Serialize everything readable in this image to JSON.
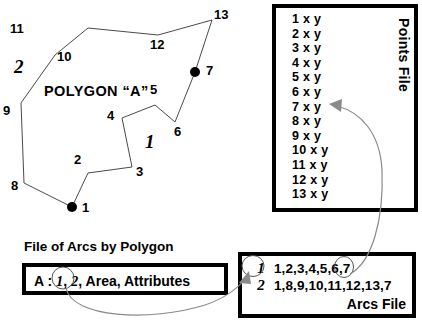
{
  "diagram": {
    "polygon": {
      "title": "POLYGON “A”",
      "arc_labels": [
        {
          "id": "arc-label-2",
          "text": "2",
          "x": 14,
          "y": 57
        },
        {
          "id": "arc-label-1",
          "text": "1",
          "x": 145,
          "y": 132
        }
      ],
      "vertex_labels": [
        {
          "id": "vertex-1",
          "text": "1",
          "x": 82,
          "y": 201
        },
        {
          "id": "vertex-2",
          "text": "2",
          "x": 74,
          "y": 153
        },
        {
          "id": "vertex-3",
          "text": "3",
          "x": 136,
          "y": 165
        },
        {
          "id": "vertex-4",
          "text": "4",
          "x": 107,
          "y": 109
        },
        {
          "id": "vertex-5",
          "text": "5",
          "x": 150,
          "y": 83
        },
        {
          "id": "vertex-6",
          "text": "6",
          "x": 174,
          "y": 125
        },
        {
          "id": "vertex-7",
          "text": "7",
          "x": 206,
          "y": 64
        },
        {
          "id": "vertex-8",
          "text": "8",
          "x": 11,
          "y": 179
        },
        {
          "id": "vertex-9",
          "text": "9",
          "x": 3,
          "y": 104
        },
        {
          "id": "vertex-10",
          "text": "10",
          "x": 57,
          "y": 50
        },
        {
          "id": "vertex-11",
          "text": "11",
          "x": 10,
          "y": 22
        },
        {
          "id": "vertex-12",
          "text": "12",
          "x": 150,
          "y": 38
        },
        {
          "id": "vertex-13",
          "text": "13",
          "x": 214,
          "y": 8
        }
      ],
      "nodes": [
        {
          "id": "node-1",
          "x": 72,
          "y": 207
        },
        {
          "id": "node-7",
          "x": 195,
          "y": 72
        }
      ],
      "arc_1_path": "M 72 207 L 88 173 L 132 167 L 122 118 L 155 105 L 175 122 L 195 72",
      "arc_2_path": "M 72 207 L 24 183 L 21 103 L 55 55 L 88 28 L 158 35 L 212 20 L 195 72"
    },
    "points_file": {
      "title": "Points File",
      "rows": [
        "1 x y",
        "2 x y",
        "3 x y",
        "4 x y",
        "5 x y",
        "6 x y",
        "7 x y",
        "8 x y",
        "9 x y",
        "10 x y",
        "11 x y",
        "12 x y",
        "13 x y"
      ]
    },
    "arcs_by_polygon": {
      "heading": "File of Arcs by Polygon",
      "prefix": "A :",
      "arc_first": "1",
      "separator": ",",
      "arc_second": "2",
      "suffix": ", Area, Attributes"
    },
    "arcs_file": {
      "title": "Arcs File",
      "rows": [
        {
          "id": "1",
          "points": "1,2,3,4,5,6,7"
        },
        {
          "id": "2",
          "points": "1,8,9,10,11,12,13,7"
        }
      ]
    },
    "colors": {
      "ink": "#000000",
      "polygon_stroke": "#4a4a4a",
      "link_stroke": "#8a8a8a"
    }
  }
}
